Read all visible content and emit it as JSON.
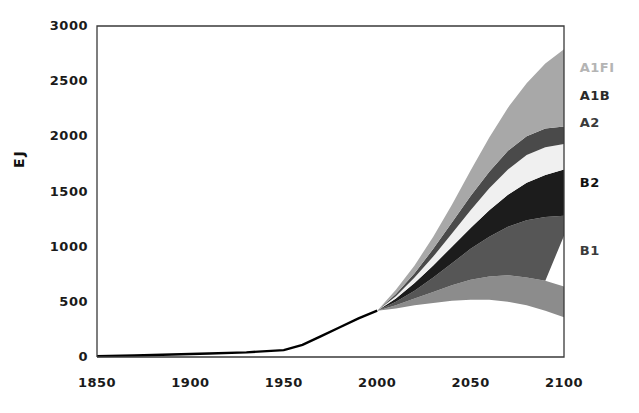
{
  "chart_data": {
    "type": "area",
    "title": "",
    "subtitle": "",
    "xlabel": "",
    "ylabel": "EJ",
    "xlim": [
      1850,
      2100
    ],
    "ylim": [
      0,
      3000
    ],
    "grid": false,
    "legend_position": "right-inline",
    "xticks": [
      "1850",
      "1900",
      "1950",
      "2000",
      "2050",
      "2100"
    ],
    "xtick_values": [
      1850,
      1900,
      1950,
      2000,
      2050,
      2100
    ],
    "yticks": [
      "0",
      "500",
      "1000",
      "1500",
      "2000",
      "2500",
      "3000"
    ],
    "ytick_values": [
      0,
      500,
      1000,
      1500,
      2000,
      2500,
      3000
    ],
    "historical": {
      "name": "Historical primary energy",
      "color": "#000000",
      "x": [
        1850,
        1870,
        1890,
        1910,
        1930,
        1950,
        1960,
        1970,
        1980,
        1990,
        2000
      ],
      "values": [
        8,
        14,
        22,
        32,
        42,
        62,
        110,
        190,
        270,
        350,
        420
      ]
    },
    "x": [
      2000,
      2010,
      2020,
      2030,
      2040,
      2050,
      2060,
      2070,
      2080,
      2090,
      2100
    ],
    "series": [
      {
        "name": "A1FI",
        "color": "#a8a8a8",
        "label_color": "#b4b4b4",
        "upper": [
          420,
          610,
          830,
          1090,
          1380,
          1690,
          1990,
          2260,
          2480,
          2660,
          2790
        ],
        "lower": [
          420,
          570,
          760,
          980,
          1220,
          1460,
          1680,
          1870,
          2000,
          2070,
          2090
        ]
      },
      {
        "name": "A1B",
        "color": "#4a4a4a",
        "label_color": "#2a2a2a",
        "upper": [
          420,
          570,
          760,
          980,
          1220,
          1460,
          1680,
          1870,
          2000,
          2070,
          2090
        ],
        "lower": [
          420,
          550,
          720,
          910,
          1120,
          1330,
          1530,
          1700,
          1830,
          1900,
          1930
        ]
      },
      {
        "name": "A2",
        "color": "#f0f0f0",
        "label_color": "#3a3a3a",
        "upper": [
          420,
          550,
          720,
          910,
          1120,
          1330,
          1530,
          1700,
          1830,
          1900,
          1930
        ],
        "lower": [
          420,
          530,
          670,
          830,
          1000,
          1170,
          1330,
          1470,
          1580,
          1650,
          1700
        ]
      },
      {
        "name": "B2",
        "color": "#1c1c1c",
        "label_color": "#111111",
        "upper": [
          420,
          530,
          670,
          830,
          1000,
          1170,
          1330,
          1470,
          1580,
          1650,
          1700
        ],
        "lower": [
          420,
          500,
          600,
          720,
          850,
          980,
          1090,
          1180,
          1240,
          1270,
          1280
        ]
      },
      {
        "name": "B1",
        "color": "#565656",
        "label_color": "#3a3a3a",
        "upper": [
          420,
          500,
          600,
          720,
          850,
          980,
          1090,
          1180,
          1240,
          1270,
          1280
        ],
        "lower": [
          420,
          470,
          530,
          590,
          650,
          700,
          730,
          740,
          720,
          690,
          1100
        ]
      }
    ],
    "envelope": {
      "name": "scenario-envelope-lower",
      "color": "#8c8c8c",
      "upper": [
        420,
        470,
        530,
        590,
        650,
        700,
        730,
        740,
        720,
        690,
        640
      ],
      "lower": [
        420,
        440,
        470,
        490,
        510,
        520,
        520,
        500,
        470,
        420,
        360
      ]
    },
    "annotations": [
      {
        "text": "A1FI",
        "x": 2102,
        "y": 2620
      },
      {
        "text": "A1B",
        "x": 2102,
        "y": 2370
      },
      {
        "text": "A2",
        "x": 2102,
        "y": 2120
      },
      {
        "text": "B2",
        "x": 2102,
        "y": 1580
      },
      {
        "text": "B1",
        "x": 2102,
        "y": 960
      }
    ]
  },
  "axes": {
    "frame_color": "#3a3a3a",
    "background": "#ffffff"
  },
  "labels": {
    "y_axis_title": "EJ",
    "scenarios": [
      "A1FI",
      "A1B",
      "A2",
      "B2",
      "B1"
    ]
  }
}
